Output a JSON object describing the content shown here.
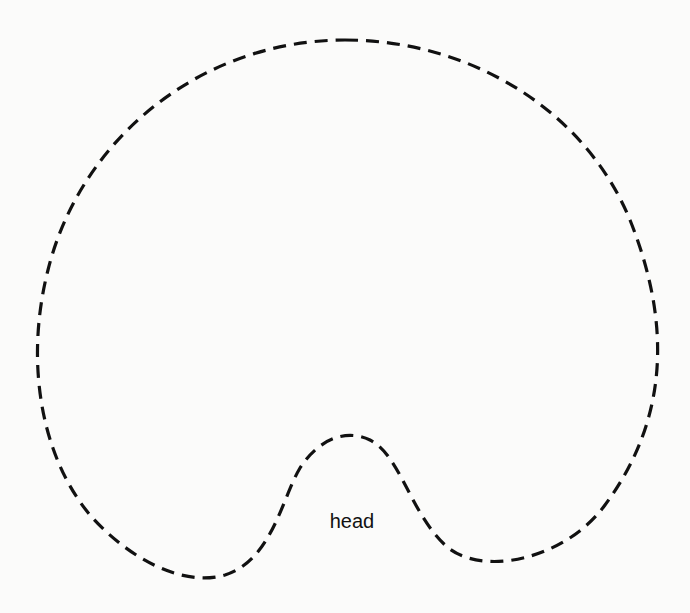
{
  "diagram": {
    "label": "head",
    "stroke_color": "#111111",
    "background": "#fbfbfa",
    "outline_style": "dashed"
  }
}
